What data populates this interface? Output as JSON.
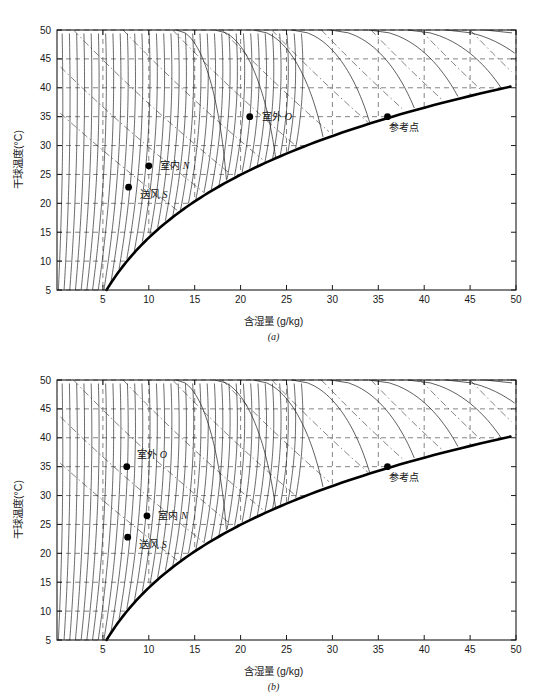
{
  "figures": [
    {
      "id": "a",
      "caption": "(a)",
      "axes": {
        "xlabel": "含湿量 (g/kg)",
        "ylabel": "干球温度(°C)",
        "xticks": [
          5,
          10,
          15,
          20,
          25,
          30,
          35,
          40,
          45,
          50
        ],
        "yticks": [
          5,
          10,
          15,
          20,
          25,
          30,
          35,
          40,
          45,
          50
        ],
        "xlim": [
          0,
          50
        ],
        "ylim": [
          5,
          50
        ]
      },
      "points": [
        {
          "name": "outdoor",
          "label_cn": "室外",
          "label_sym": "O",
          "x": 21.0,
          "y": 35.0,
          "label_dx": 12,
          "label_dy": 3
        },
        {
          "name": "indoor",
          "label_cn": "室内",
          "label_sym": "N",
          "x": 10.0,
          "y": 26.5,
          "label_dx": 11,
          "label_dy": 3
        },
        {
          "name": "supply-air",
          "label_cn": "送风",
          "label_sym": "S",
          "x": 7.8,
          "y": 22.8,
          "label_dx": 11,
          "label_dy": 11
        },
        {
          "name": "reference-point",
          "label_cn": "参考点",
          "label_sym": "",
          "x": 36.0,
          "y": 35.0,
          "label_dx": 2,
          "label_dy": 14
        }
      ]
    },
    {
      "id": "b",
      "caption": "(b)",
      "axes": {
        "xlabel": "含湿量 (g/kg)",
        "ylabel": "干球温度(°C)",
        "xticks": [
          5,
          10,
          15,
          20,
          25,
          30,
          35,
          40,
          45,
          50
        ],
        "yticks": [
          5,
          10,
          15,
          20,
          25,
          30,
          35,
          40,
          45,
          50
        ],
        "xlim": [
          0,
          50
        ],
        "ylim": [
          5,
          50
        ]
      },
      "points": [
        {
          "name": "outdoor",
          "label_cn": "室外",
          "label_sym": "O",
          "x": 7.6,
          "y": 35.0,
          "label_dx": 10,
          "label_dy": -9
        },
        {
          "name": "indoor",
          "label_cn": "室内",
          "label_sym": "N",
          "x": 9.8,
          "y": 26.5,
          "label_dx": 11,
          "label_dy": 3
        },
        {
          "name": "supply-air",
          "label_cn": "送风",
          "label_sym": "S",
          "x": 7.7,
          "y": 22.8,
          "label_dx": 11,
          "label_dy": 11
        },
        {
          "name": "reference-point",
          "label_cn": "参考点",
          "label_sym": "",
          "x": 36.0,
          "y": 35.0,
          "label_dx": 2,
          "label_dy": 14
        }
      ]
    }
  ],
  "chart_data": {
    "type": "line",
    "title": "",
    "subtitle": "",
    "charts": [
      {
        "id": "a",
        "caption": "(a)",
        "xlabel": "含湿量 (g/kg)",
        "ylabel": "干球温度(°C)",
        "xlim": [
          0,
          50
        ],
        "ylim": [
          5,
          50
        ],
        "xticks": [
          5,
          10,
          15,
          20,
          25,
          30,
          35,
          40,
          45,
          50
        ],
        "yticks": [
          5,
          10,
          15,
          20,
          25,
          30,
          35,
          40,
          45,
          50
        ],
        "grid": "dashed",
        "legend": "none",
        "series": [
          {
            "name": "saturation-curve",
            "style": "thick-solid",
            "description": "100% relative humidity boundary running from (5,5) up to (50,41)"
          },
          {
            "name": "contour-family-near-vertical",
            "style": "thin-solid",
            "count": 34,
            "description": "dense family of near-vertical iso-lines fanning from lower-left, steepening toward the saturation curve"
          },
          {
            "name": "contour-family-arc",
            "style": "thin-solid",
            "count": 9,
            "description": "arc-shaped contours in the upper right bending over from the top edge toward the saturation curve"
          },
          {
            "name": "contour-family-diagonal-dashed",
            "style": "thin-dashed",
            "count": 10,
            "description": "diagonal dash-dot lines sloping down-left to up-right across the field"
          }
        ],
        "annotations": [
          {
            "text": "室外 O",
            "x": 21.0,
            "y": 35.0,
            "marker": "filled-circle"
          },
          {
            "text": "室内 N",
            "x": 10.0,
            "y": 26.5,
            "marker": "filled-circle"
          },
          {
            "text": "送风 S",
            "x": 7.8,
            "y": 22.8,
            "marker": "filled-circle"
          },
          {
            "text": "参考点",
            "x": 36.0,
            "y": 35.0,
            "marker": "filled-circle"
          }
        ]
      },
      {
        "id": "b",
        "caption": "(b)",
        "xlabel": "含湿量 (g/kg)",
        "ylabel": "干球温度(°C)",
        "xlim": [
          0,
          50
        ],
        "ylim": [
          5,
          50
        ],
        "xticks": [
          5,
          10,
          15,
          20,
          25,
          30,
          35,
          40,
          45,
          50
        ],
        "yticks": [
          5,
          10,
          15,
          20,
          25,
          30,
          35,
          40,
          45,
          50
        ],
        "grid": "dashed",
        "legend": "none",
        "series": [
          {
            "name": "saturation-curve",
            "style": "thick-solid",
            "description": "100% relative humidity boundary running from (5,5) up to (50,41)"
          },
          {
            "name": "contour-family-near-vertical",
            "style": "thin-solid",
            "count": 34,
            "description": "dense family of near-vertical iso-lines fanning from lower-left, steepening toward the saturation curve"
          },
          {
            "name": "contour-family-arc",
            "style": "thin-solid",
            "count": 9,
            "description": "arc-shaped contours in the upper right bending over from the top edge toward the saturation curve"
          },
          {
            "name": "contour-family-diagonal-dashed",
            "style": "thin-dashed",
            "count": 10,
            "description": "diagonal dash-dot lines sloping down-left to up-right across the field"
          }
        ],
        "annotations": [
          {
            "text": "室外 O",
            "x": 7.6,
            "y": 35.0,
            "marker": "filled-circle"
          },
          {
            "text": "室内 N",
            "x": 9.8,
            "y": 26.5,
            "marker": "filled-circle"
          },
          {
            "text": "送风 S",
            "x": 7.7,
            "y": 22.8,
            "marker": "filled-circle"
          },
          {
            "text": "参考点",
            "x": 36.0,
            "y": 35.0,
            "marker": "filled-circle"
          }
        ]
      }
    ]
  },
  "colors": {
    "axis": "#1a1a1a",
    "curve": "#1a1a1a",
    "saturation": "#000000",
    "grid": "#333333",
    "marker": "#000000",
    "background": "#ffffff"
  }
}
